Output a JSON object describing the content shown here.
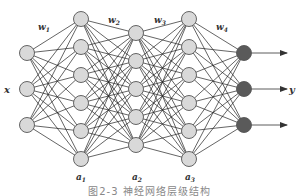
{
  "diagram": {
    "caption": "图2-3 神经网络层级结构",
    "input_label": "x",
    "output_label": "y",
    "weights": [
      {
        "label": "w",
        "sub": "1"
      },
      {
        "label": "w",
        "sub": "2"
      },
      {
        "label": "w",
        "sub": "3"
      },
      {
        "label": "w",
        "sub": "4"
      }
    ],
    "hidden_labels": [
      {
        "label": "a",
        "sub": "1"
      },
      {
        "label": "a",
        "sub": "2"
      },
      {
        "label": "a",
        "sub": "3"
      }
    ],
    "layers": [
      {
        "name": "input",
        "x": 27,
        "nodes": [
          53,
          89,
          125
        ],
        "fill": "#d9d9d9"
      },
      {
        "name": "hidden-1",
        "x": 81,
        "nodes": [
          19,
          47,
          75,
          103,
          131,
          159
        ],
        "fill": "#d9d9d9"
      },
      {
        "name": "hidden-2",
        "x": 136,
        "nodes": [
          33,
          61,
          89,
          117,
          145
        ],
        "fill": "#d9d9d9"
      },
      {
        "name": "hidden-3",
        "x": 189,
        "nodes": [
          19,
          47,
          75,
          103,
          131,
          159
        ],
        "fill": "#d9d9d9"
      },
      {
        "name": "output",
        "x": 244,
        "nodes": [
          53,
          89,
          125
        ],
        "fill": "#5a5a5a"
      }
    ],
    "node_radius": 7.5,
    "edge_color": "#222222",
    "node_stroke": "#555555",
    "arrow_end_x": 287
  }
}
